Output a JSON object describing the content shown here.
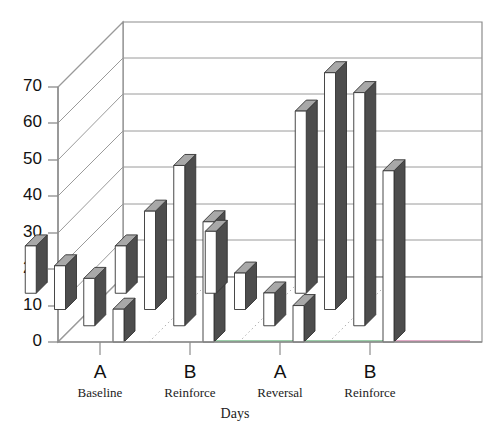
{
  "chart_data": {
    "type": "bar",
    "title": "",
    "subtitle": "",
    "xlabel": "Days",
    "ylabel": "",
    "ylim": [
      0,
      75
    ],
    "yticks": [
      0,
      10,
      20,
      30,
      40,
      50,
      60,
      70
    ],
    "ytick_labels": [
      "0",
      "10",
      "20",
      "30",
      "40",
      "50",
      "60",
      "70"
    ],
    "grid": true,
    "grid_orientation": "horizontal",
    "legend": "none",
    "projection": "3d",
    "categories": [
      "A",
      "B",
      "A",
      "B"
    ],
    "category_sublabels": [
      "Baseline",
      "Reinforce",
      "Reversal",
      "Reinforce"
    ],
    "series": [
      {
        "name": "Day 1",
        "values": [
          13,
          13,
          17,
          50
        ]
      },
      {
        "name": "Day 2",
        "values": [
          12,
          27,
          10,
          65
        ]
      },
      {
        "name": "Day 3",
        "values": [
          13,
          44,
          9,
          64
        ]
      },
      {
        "name": "Day 4",
        "values": [
          9,
          33,
          10,
          47
        ]
      }
    ],
    "bar_face_color": "#ffffff",
    "bar_side_color": "#4d4d4d",
    "bar_top_color": "#a8a8a8",
    "bar_edge_color": "#333333",
    "axis_color": "#8c8c8c",
    "grid_color": "#9a9a9a",
    "floor_accent_colors": [
      "#7bbf8e",
      "#d98fb5"
    ]
  },
  "axes": {
    "y_tick_labels": [
      "70",
      "60",
      "50",
      "40",
      "30",
      "20",
      "10",
      "0"
    ],
    "x_group_labels": [
      "A",
      "B",
      "A",
      "B"
    ],
    "x_group_sublabels": [
      "Baseline",
      "Reinforce",
      "Reversal",
      "Reinforce"
    ],
    "x_axis_title": "Days"
  }
}
